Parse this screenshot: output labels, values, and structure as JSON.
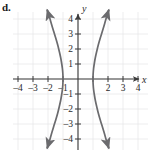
{
  "part_label": "d.",
  "chart_data": {
    "type": "line",
    "title": "",
    "subtitle": "",
    "xlabel": "x",
    "ylabel": "y",
    "xlim": [
      -4.8,
      4.8
    ],
    "ylim": [
      -4.9,
      4.9
    ],
    "grid": true,
    "grid_color": "#e8e8ea",
    "axis_color": "#3a3a3a",
    "curve_color": "#6b6b6e",
    "legend": "none",
    "x_tick_labels": [
      "-4",
      "-3",
      "-2",
      "-1",
      "2",
      "3",
      "4"
    ],
    "x_tick_values": [
      -4,
      -3,
      -2,
      -1,
      2,
      3,
      4
    ],
    "y_tick_labels": [
      "4",
      "3",
      "2",
      "1",
      "-1",
      "-2",
      "-3",
      "-4"
    ],
    "y_tick_values": [
      4,
      3,
      2,
      1,
      -1,
      -2,
      -3,
      -4
    ],
    "annotations": [],
    "series": [
      {
        "name": "left-branch",
        "equation": "x^2 - y^2/9 = 1, x <= -1",
        "vertex": [
          -1,
          0
        ],
        "arrow_ends": [
          "upper-left",
          "lower-left"
        ],
        "points": [
          [
            -2.05,
            4.6
          ],
          [
            -1.92,
            4.2
          ],
          [
            -1.78,
            3.7
          ],
          [
            -1.63,
            3.2
          ],
          [
            -1.49,
            2.75
          ],
          [
            -1.36,
            2.3
          ],
          [
            -1.25,
            1.85
          ],
          [
            -1.16,
            1.45
          ],
          [
            -1.09,
            1.05
          ],
          [
            -1.04,
            0.7
          ],
          [
            -1.01,
            0.35
          ],
          [
            -1.0,
            0.0
          ],
          [
            -1.01,
            -0.35
          ],
          [
            -1.04,
            -0.7
          ],
          [
            -1.09,
            -1.05
          ],
          [
            -1.16,
            -1.45
          ],
          [
            -1.25,
            -1.85
          ],
          [
            -1.36,
            -2.3
          ],
          [
            -1.49,
            -2.75
          ],
          [
            -1.63,
            -3.2
          ],
          [
            -1.78,
            -3.7
          ],
          [
            -1.92,
            -4.2
          ],
          [
            -2.05,
            -4.6
          ]
        ]
      },
      {
        "name": "right-branch",
        "equation": "x^2 - y^2/9 = 1, x >= 1",
        "vertex": [
          1,
          0
        ],
        "arrow_ends": [
          "upper-right",
          "lower-right"
        ],
        "points": [
          [
            2.05,
            4.6
          ],
          [
            1.92,
            4.2
          ],
          [
            1.78,
            3.7
          ],
          [
            1.63,
            3.2
          ],
          [
            1.49,
            2.75
          ],
          [
            1.36,
            2.3
          ],
          [
            1.25,
            1.85
          ],
          [
            1.16,
            1.45
          ],
          [
            1.09,
            1.05
          ],
          [
            1.04,
            0.7
          ],
          [
            1.01,
            0.35
          ],
          [
            1.0,
            0.0
          ],
          [
            1.01,
            -0.35
          ],
          [
            1.04,
            -0.7
          ],
          [
            1.09,
            -1.05
          ],
          [
            1.16,
            -1.45
          ],
          [
            1.25,
            -1.85
          ],
          [
            1.36,
            -2.3
          ],
          [
            1.49,
            -2.75
          ],
          [
            1.63,
            -3.2
          ],
          [
            1.78,
            -3.7
          ],
          [
            1.92,
            -4.2
          ],
          [
            2.05,
            -4.6
          ]
        ]
      }
    ]
  }
}
